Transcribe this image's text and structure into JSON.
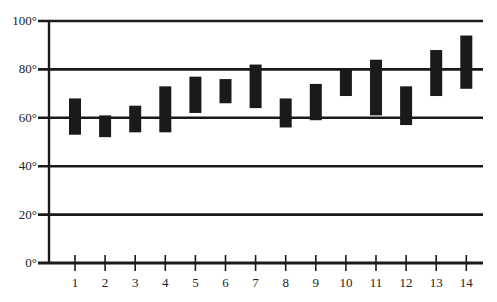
{
  "chart_data": {
    "type": "bar",
    "subtype": "floating-range",
    "title": "",
    "xlabel": "",
    "ylabel": "",
    "categories": [
      "1",
      "2",
      "3",
      "4",
      "5",
      "6",
      "7",
      "8",
      "9",
      "10",
      "11",
      "12",
      "13",
      "14"
    ],
    "series": [
      {
        "name": "high",
        "values": [
          68,
          61,
          65,
          73,
          77,
          76,
          82,
          68,
          74,
          80,
          84,
          73,
          88,
          94
        ]
      },
      {
        "name": "low",
        "values": [
          53,
          52,
          54,
          54,
          62,
          66,
          64,
          56,
          59,
          69,
          61,
          57,
          69,
          72
        ]
      }
    ],
    "yticks": [
      0,
      20,
      40,
      60,
      80,
      100
    ],
    "ytick_labels": [
      "0°",
      "20°",
      "40°",
      "60°",
      "80°",
      "100°"
    ],
    "ylim": [
      0,
      100
    ],
    "grid": true,
    "legend": "none",
    "colors": {
      "bar": "#1a1a1a",
      "grid": "#1a1a1a",
      "text": "#222222"
    }
  }
}
